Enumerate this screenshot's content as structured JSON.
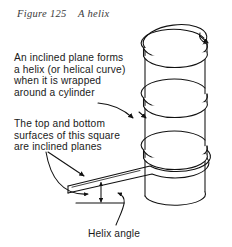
{
  "figure": {
    "caption": "Figure 125    A helix",
    "domain_kind": "technical-line-drawing"
  },
  "annotations": {
    "helix_definition": "An inclined plane forms\na helix (or helical curve)\nwhen it is wrapped\naround a cylinder",
    "square_surfaces": "The top and bottom\nsurfaces of this square\nare inclined planes",
    "helix_angle_label": "Helix angle"
  },
  "drawing": {
    "title": "A helix: a square strip wrapped helically around a vertical cylinder",
    "stroke_color": "#111111",
    "fill_color": "#ffffff",
    "background": "#ffffff",
    "parts": [
      {
        "name": "cylinder",
        "description": "vertical right circular cylinder, elliptical top"
      },
      {
        "name": "helical-band",
        "description": "square cross-section strip wrapped around cylinder, 3 turns"
      },
      {
        "name": "inclined-plane-tail",
        "description": "flat strip projecting down-left from bottom of helix"
      },
      {
        "name": "helix-angle-indicator",
        "description": "vertical double arrow between strip and horizontal datum"
      },
      {
        "name": "horizontal-datum-line",
        "description": "short horizontal reference line under the strip"
      },
      {
        "name": "leader-lines",
        "description": "curved/straight callout leaders with arrowheads"
      }
    ]
  }
}
